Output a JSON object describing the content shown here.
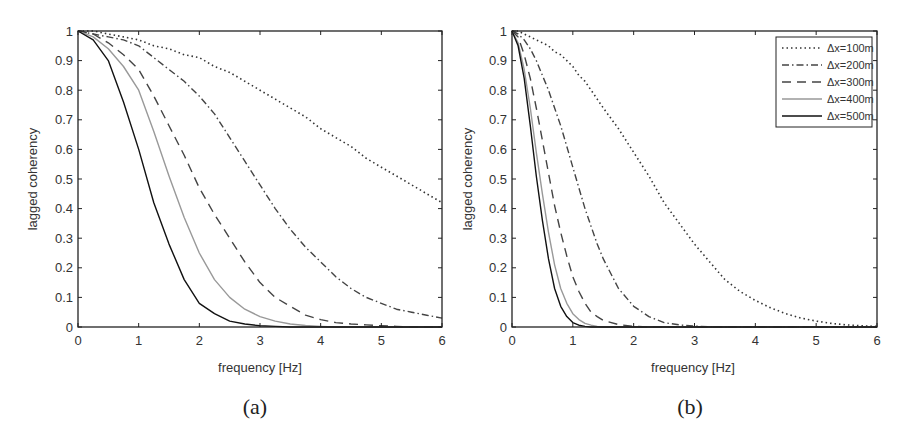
{
  "chart_data": [
    {
      "type": "line",
      "panel_label": "(a)",
      "xlabel": "frequency [Hz]",
      "ylabel": "lagged coherency",
      "xlim": [
        0,
        6
      ],
      "ylim": [
        0,
        1
      ],
      "xticks": [
        "0",
        "1",
        "2",
        "3",
        "4",
        "5",
        "6"
      ],
      "yticks": [
        "0",
        "0.1",
        "0.2",
        "0.3",
        "0.4",
        "0.5",
        "0.6",
        "0.7",
        "0.8",
        "0.9",
        "1"
      ],
      "grid": false,
      "legend": null,
      "x": [
        0,
        0.25,
        0.5,
        0.75,
        1,
        1.25,
        1.5,
        1.75,
        2,
        2.25,
        2.5,
        2.75,
        3,
        3.25,
        3.5,
        3.75,
        4,
        4.25,
        4.5,
        4.75,
        5,
        5.25,
        5.5,
        5.75,
        6
      ],
      "series": [
        {
          "name": "Δx=100m",
          "style": "dotted",
          "color": "#333333",
          "values": [
            1.0,
            1.0,
            0.99,
            0.98,
            0.97,
            0.95,
            0.94,
            0.92,
            0.91,
            0.88,
            0.86,
            0.83,
            0.8,
            0.77,
            0.74,
            0.71,
            0.67,
            0.64,
            0.61,
            0.57,
            0.54,
            0.51,
            0.48,
            0.45,
            0.42
          ]
        },
        {
          "name": "Δx=200m",
          "style": "dashdot",
          "color": "#444444",
          "values": [
            1.0,
            0.99,
            0.98,
            0.97,
            0.95,
            0.91,
            0.87,
            0.83,
            0.78,
            0.72,
            0.64,
            0.56,
            0.48,
            0.4,
            0.33,
            0.27,
            0.22,
            0.17,
            0.13,
            0.1,
            0.08,
            0.06,
            0.05,
            0.04,
            0.03
          ]
        },
        {
          "name": "Δx=300m",
          "style": "dashed",
          "color": "#444444",
          "values": [
            1.0,
            0.99,
            0.96,
            0.92,
            0.87,
            0.78,
            0.68,
            0.58,
            0.47,
            0.38,
            0.3,
            0.22,
            0.15,
            0.1,
            0.07,
            0.04,
            0.025,
            0.015,
            0.01,
            0.007,
            0.004,
            0.002,
            0.0,
            0.0,
            0.0
          ]
        },
        {
          "name": "Δx=400m",
          "style": "solid",
          "color": "#999999",
          "values": [
            1.0,
            0.98,
            0.94,
            0.88,
            0.8,
            0.66,
            0.51,
            0.37,
            0.25,
            0.16,
            0.1,
            0.06,
            0.035,
            0.02,
            0.01,
            0.005,
            0.002,
            0.0,
            0.0,
            0.0,
            0.0,
            0.0,
            0.0,
            0.0,
            0.0
          ]
        },
        {
          "name": "Δx=500m",
          "style": "solid",
          "color": "#111111",
          "values": [
            1.0,
            0.97,
            0.9,
            0.76,
            0.6,
            0.42,
            0.28,
            0.16,
            0.08,
            0.045,
            0.02,
            0.01,
            0.004,
            0.002,
            0.0,
            0.0,
            0.0,
            0.0,
            0.0,
            0.0,
            0.0,
            0.0,
            0.0,
            0.0,
            0.0
          ]
        }
      ]
    },
    {
      "type": "line",
      "panel_label": "(b)",
      "xlabel": "frequency [Hz]",
      "ylabel": "lagged coherency",
      "xlim": [
        0,
        6
      ],
      "ylim": [
        0,
        1
      ],
      "xticks": [
        "0",
        "1",
        "2",
        "3",
        "4",
        "5",
        "6"
      ],
      "yticks": [
        "0",
        "0.1",
        "0.2",
        "0.3",
        "0.4",
        "0.5",
        "0.6",
        "0.7",
        "0.8",
        "0.9",
        "1"
      ],
      "grid": false,
      "legend": {
        "position": "upper right",
        "entries": [
          "Δx=100m",
          "Δx=200m",
          "Δx=300m",
          "Δx=400m",
          "Δx=500m"
        ]
      },
      "x": [
        0,
        0.1,
        0.2,
        0.3,
        0.4,
        0.5,
        0.6,
        0.7,
        0.8,
        0.9,
        1.0,
        1.1,
        1.2,
        1.3,
        1.4,
        1.5,
        1.75,
        2.0,
        2.25,
        2.5,
        2.75,
        3.0,
        3.25,
        3.5,
        3.75,
        4.0,
        4.25,
        4.5,
        4.75,
        5.0,
        5.25,
        5.5,
        5.75,
        6.0
      ],
      "series": [
        {
          "name": "Δx=100m",
          "style": "dotted",
          "color": "#333333",
          "values": [
            1.0,
            1.0,
            0.99,
            0.98,
            0.97,
            0.96,
            0.95,
            0.93,
            0.92,
            0.9,
            0.88,
            0.85,
            0.83,
            0.8,
            0.77,
            0.74,
            0.67,
            0.59,
            0.51,
            0.42,
            0.35,
            0.28,
            0.22,
            0.16,
            0.12,
            0.09,
            0.065,
            0.045,
            0.03,
            0.02,
            0.012,
            0.007,
            0.004,
            0.002
          ]
        },
        {
          "name": "Δx=200m",
          "style": "dashdot",
          "color": "#444444",
          "values": [
            1.0,
            0.99,
            0.97,
            0.94,
            0.9,
            0.85,
            0.8,
            0.74,
            0.68,
            0.61,
            0.54,
            0.47,
            0.4,
            0.34,
            0.28,
            0.23,
            0.13,
            0.07,
            0.035,
            0.015,
            0.007,
            0.003,
            0.001,
            0.0,
            0.0,
            0.0,
            0.0,
            0.0,
            0.0,
            0.0,
            0.0,
            0.0,
            0.0,
            0.0
          ]
        },
        {
          "name": "Δx=300m",
          "style": "dashed",
          "color": "#444444",
          "values": [
            1.0,
            0.98,
            0.92,
            0.84,
            0.74,
            0.63,
            0.52,
            0.41,
            0.32,
            0.24,
            0.17,
            0.12,
            0.08,
            0.05,
            0.035,
            0.022,
            0.008,
            0.002,
            0.0,
            0.0,
            0.0,
            0.0,
            0.0,
            0.0,
            0.0,
            0.0,
            0.0,
            0.0,
            0.0,
            0.0,
            0.0,
            0.0,
            0.0,
            0.0
          ]
        },
        {
          "name": "Δx=400m",
          "style": "solid",
          "color": "#999999",
          "values": [
            1.0,
            0.96,
            0.87,
            0.74,
            0.59,
            0.45,
            0.32,
            0.21,
            0.13,
            0.08,
            0.045,
            0.025,
            0.012,
            0.006,
            0.002,
            0.0,
            0.0,
            0.0,
            0.0,
            0.0,
            0.0,
            0.0,
            0.0,
            0.0,
            0.0,
            0.0,
            0.0,
            0.0,
            0.0,
            0.0,
            0.0,
            0.0,
            0.0,
            0.0
          ]
        },
        {
          "name": "Δx=500m",
          "style": "solid",
          "color": "#111111",
          "values": [
            1.0,
            0.95,
            0.84,
            0.68,
            0.51,
            0.36,
            0.23,
            0.13,
            0.07,
            0.035,
            0.015,
            0.006,
            0.002,
            0.0,
            0.0,
            0.0,
            0.0,
            0.0,
            0.0,
            0.0,
            0.0,
            0.0,
            0.0,
            0.0,
            0.0,
            0.0,
            0.0,
            0.0,
            0.0,
            0.0,
            0.0,
            0.0,
            0.0,
            0.0
          ]
        }
      ]
    }
  ]
}
